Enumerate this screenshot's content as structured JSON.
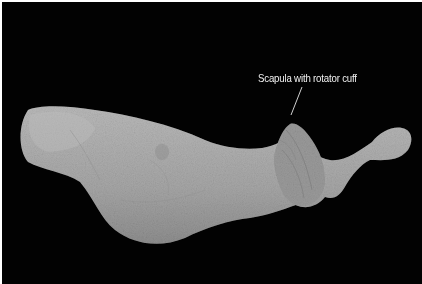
{
  "image": {
    "subject": "Dissected specimen: skin of trunk and upper limb with scapula",
    "background_color": "#020202",
    "specimen_color": "#a9a9a9"
  },
  "annotations": [
    {
      "text": "Scapula with rotator cuff",
      "target": "scapula"
    }
  ]
}
